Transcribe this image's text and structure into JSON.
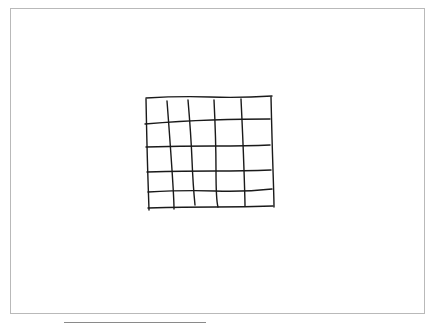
{
  "canvas": {
    "border_color": "#b9b9b9",
    "background": "#ffffff"
  },
  "sketch": {
    "description": "hand-drawn grid",
    "stroke_color": "#1a1a1a",
    "rows": 5,
    "columns": 5,
    "horizontal_lines": [
      "M146 98 Q180 96 210 97 T272 96",
      "M145 124 Q180 121 212 120 T270 119",
      "M146 147 Q180 146 214 146 T270 145",
      "M147 172 Q185 171 215 171 T271 170",
      "M148 192 Q185 190 215 191 T272 189",
      "M148 208 Q185 207 215 207 T273 206"
    ],
    "vertical_lines": [
      "M146 99 Q147 150 148 180 T149 210",
      "M167 101 Q170 140 172 170 T174 209",
      "M188 100 Q191 135 192 160 T195 205",
      "M214 100 Q216 140 216 170 T218 207",
      "M241 99 Q243 140 244 170 T245 206",
      "M271 97 Q272 140 273 170 T274 207"
    ]
  },
  "underline": {
    "color": "#8a8a8a"
  }
}
